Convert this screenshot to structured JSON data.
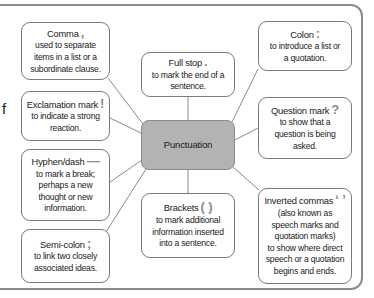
{
  "partial_left_text": "f",
  "center": {
    "label": "Punctuation",
    "fill": "#b3b3b3"
  },
  "nodes": [
    {
      "id": "comma",
      "title": "Comma",
      "symbol": ",",
      "description": "used to separate\nitems in a list or a\nsubordinate clause."
    },
    {
      "id": "exclamation",
      "title": "Exclamation mark",
      "symbol": "!",
      "description": "to indicate a strong\nreaction."
    },
    {
      "id": "hyphen",
      "title": "Hyphen/dash",
      "symbol": "—",
      "description": "to mark a break;\nperhaps a new\nthought or new\ninformation."
    },
    {
      "id": "semicolon",
      "title": "Semi-colon",
      "symbol": ";",
      "description": "to link two closely\nassociated ideas."
    },
    {
      "id": "fullstop",
      "title": "Full stop",
      "symbol": ".",
      "description": "to mark the end of a\nsentence."
    },
    {
      "id": "brackets",
      "title": "Brackets",
      "symbol": "( )",
      "description": "to mark additional\ninformation inserted\ninto a sentence."
    },
    {
      "id": "colon",
      "title": "Colon",
      "symbol": ":",
      "description": "to introduce a list or\na quotation."
    },
    {
      "id": "question",
      "title": "Question mark",
      "symbol": "?",
      "description": "to show that a\nquestion is being\nasked."
    },
    {
      "id": "inverted",
      "title": "Inverted commas",
      "symbol": "‘ ’",
      "description": "(also known as\nspeech marks and\nquotation marks)\nto show where direct\nspeech or a quotation\nbegins and ends."
    }
  ]
}
